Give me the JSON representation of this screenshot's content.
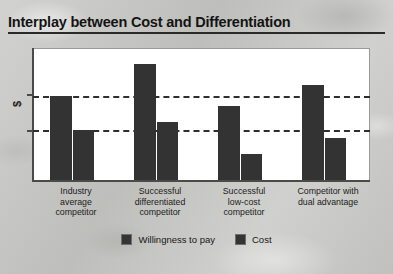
{
  "title": "Interplay between Cost and Differentiation",
  "chart_data": {
    "type": "bar",
    "title": "Interplay between Cost and Differentiation",
    "xlabel": "",
    "ylabel": "$",
    "grid": false,
    "legend_position": "bottom-center",
    "categories": [
      "Industry average competitor",
      "Successful differentiated competitor",
      "Successful low-cost competitor",
      "Competitor with dual advantage"
    ],
    "category_lines": [
      [
        "Industry",
        "average",
        "competitor"
      ],
      [
        "Successful",
        "differentiated",
        "competitor"
      ],
      [
        "Successful",
        "low-cost",
        "competitor"
      ],
      [
        "Competitor with",
        "dual advantage"
      ]
    ],
    "series": [
      {
        "name": "Willingness to pay",
        "values": [
          64,
          88,
          56,
          72
        ],
        "color": "#333333"
      },
      {
        "name": "Cost",
        "values": [
          38,
          44,
          20,
          32
        ],
        "color": "#333333"
      }
    ],
    "ylim": [
      0,
      100
    ],
    "reference_lines": [
      {
        "label": "Industry average willingness to pay",
        "value": 64
      },
      {
        "label": "Industry average cost",
        "value": 38
      }
    ],
    "annotations": []
  },
  "legend": [
    {
      "label": "Willingness to pay",
      "swatch": "#343434"
    },
    {
      "label": "Cost",
      "swatch": "#343434"
    }
  ],
  "colors": {
    "bar": "#333333",
    "page_background": "#c8c8c5",
    "plot_background": "#ffffff",
    "axis": "#4a4a4a",
    "reference_line": "#2e2e2e",
    "title_text": "#141414"
  }
}
